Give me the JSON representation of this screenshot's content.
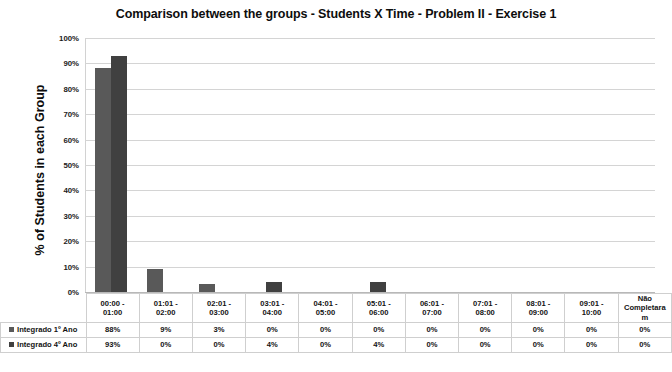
{
  "chart_data": {
    "type": "bar",
    "title": "Comparison between the groups - Students X Time - Problem II - Exercise 1",
    "xlabel": "",
    "ylabel": "% of Students in each Group",
    "ylim": [
      0,
      100
    ],
    "ytick_labels": [
      "100%",
      "90%",
      "80%",
      "70%",
      "60%",
      "50%",
      "40%",
      "30%",
      "20%",
      "10%",
      "0%"
    ],
    "ytick_values": [
      100,
      90,
      80,
      70,
      60,
      50,
      40,
      30,
      20,
      10,
      0
    ],
    "grid": true,
    "legend_position": "data-table-left",
    "categories": [
      "00:00 -\n01:00",
      "01:01 -\n02:00",
      "02:01 -\n03:00",
      "03:01 -\n04:00",
      "04:01 -\n05:00",
      "05:01 -\n06:00",
      "06:01 -\n07:00",
      "07:01 -\n08:00",
      "08:01 -\n09:00",
      "09:01 -\n10:00",
      "Não\nCompletara\nm"
    ],
    "series": [
      {
        "name": "Integrado 1º Ano",
        "color": "#595959",
        "values": [
          88,
          9,
          3,
          0,
          0,
          0,
          0,
          0,
          0,
          0,
          0
        ],
        "labels": [
          "88%",
          "9%",
          "3%",
          "0%",
          "0%",
          "0%",
          "0%",
          "0%",
          "0%",
          "0%",
          "0%"
        ]
      },
      {
        "name": "Integrado 4º Ano",
        "color": "#404040",
        "values": [
          93,
          0,
          0,
          4,
          0,
          4,
          0,
          0,
          0,
          0,
          0
        ],
        "labels": [
          "93%",
          "0%",
          "0%",
          "4%",
          "0%",
          "4%",
          "0%",
          "0%",
          "0%",
          "0%",
          "0%"
        ]
      }
    ]
  }
}
